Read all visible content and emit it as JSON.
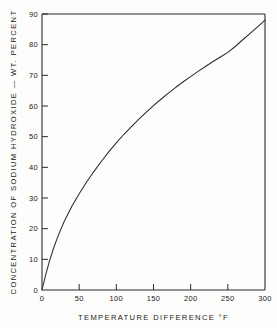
{
  "chart_data": {
    "type": "line",
    "title": "",
    "xlabel": "TEMPERATURE  DIFFERENCE  °F",
    "ylabel": "CONCENTRATION  OF  SODIUM  HYDROXIDE  —  WT. PERCENT",
    "xlim": [
      0,
      300
    ],
    "ylim": [
      0,
      90
    ],
    "xticks": [
      0,
      50,
      100,
      150,
      200,
      250,
      300
    ],
    "xticklabels": [
      "0",
      "50",
      "100",
      "150",
      "200",
      "250",
      "300"
    ],
    "yticks": [
      0,
      10,
      20,
      30,
      40,
      50,
      60,
      70,
      80,
      90
    ],
    "yticklabels": [
      "0",
      "10",
      "20",
      "30",
      "40",
      "50",
      "60",
      "70",
      "80",
      "90"
    ],
    "grid": false,
    "legend": null,
    "line_color": "#2b2b2b",
    "axis_color": "#2b2b2b",
    "series": [
      {
        "name": "sodium hydroxide boiling point elevation",
        "x": [
          0,
          5,
          10,
          15,
          20,
          25,
          30,
          40,
          50,
          60,
          70,
          80,
          90,
          100,
          110,
          120,
          130,
          140,
          150,
          160,
          170,
          180,
          190,
          200,
          210,
          220,
          230,
          240,
          250,
          260,
          270,
          280,
          290,
          300
        ],
        "y": [
          0,
          5.0,
          9.4,
          13.2,
          16.6,
          19.6,
          22.4,
          27.2,
          31.4,
          35.2,
          38.7,
          42.0,
          45.1,
          48.0,
          50.7,
          53.2,
          55.6,
          57.9,
          60.1,
          62.2,
          64.2,
          66.1,
          67.9,
          69.6,
          71.3,
          72.9,
          74.5,
          76.0,
          77.5,
          79.4,
          81.6,
          83.7,
          85.8,
          88.0
        ]
      }
    ]
  },
  "axes": {
    "x_title": "TEMPERATURE  DIFFERENCE  °F",
    "y_title": "CONCENTRATION  OF  SODIUM  HYDROXIDE  —  WT. PERCENT"
  }
}
